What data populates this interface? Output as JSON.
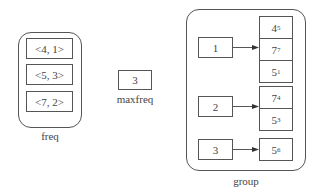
{
  "freq": {
    "label": "freq",
    "entries": [
      "<4, 1>",
      "<5, 3>",
      "<7, 2>"
    ]
  },
  "maxfreq": {
    "label": "maxfreq",
    "value": "3"
  },
  "group": {
    "label": "group",
    "buckets": [
      {
        "key": "1",
        "stack": [
          {
            "value": "4",
            "sub": "5"
          },
          {
            "value": "7",
            "sub": "7"
          },
          {
            "value": "5",
            "sub": "1"
          }
        ]
      },
      {
        "key": "2",
        "stack": [
          {
            "value": "7",
            "sub": "4"
          },
          {
            "value": "5",
            "sub": "3"
          }
        ]
      },
      {
        "key": "3",
        "stack": [
          {
            "value": "5",
            "sub": "6"
          }
        ]
      }
    ]
  },
  "colors": {
    "stroke": "#555555",
    "text": "#444444",
    "background": "#ffffff"
  }
}
